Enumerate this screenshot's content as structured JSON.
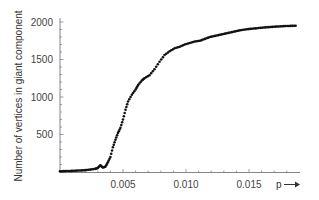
{
  "chart_data": {
    "type": "scatter",
    "title": "",
    "xlabel": "p",
    "xlabel_arrow": "→",
    "ylabel": "Number of vertices in giant component",
    "xlim": [
      0,
      0.019
    ],
    "ylim": [
      0,
      2050
    ],
    "grid": false,
    "legend": null,
    "x_ticks": [
      0.005,
      0.01,
      0.015
    ],
    "x_tick_labels": [
      "0.005",
      "0.010",
      "0.015"
    ],
    "y_ticks": [
      500,
      1000,
      1500,
      2000
    ],
    "y_tick_labels": [
      "500",
      "1000",
      "1500",
      "2000"
    ],
    "series": [
      {
        "name": "giant component size",
        "color": "#111111",
        "x": [
          0.0,
          0.0004,
          0.0008,
          0.0012,
          0.0016,
          0.002,
          0.0024,
          0.0028,
          0.003,
          0.0032,
          0.0034,
          0.0036,
          0.0038,
          0.004,
          0.0042,
          0.0044,
          0.0046,
          0.0048,
          0.005,
          0.0052,
          0.0054,
          0.0057,
          0.006,
          0.0062,
          0.0065,
          0.0067,
          0.0071,
          0.0075,
          0.0079,
          0.0083,
          0.0087,
          0.0091,
          0.0095,
          0.0099,
          0.0103,
          0.0107,
          0.0111,
          0.0115,
          0.0119,
          0.0123,
          0.0127,
          0.0131,
          0.0135,
          0.0139,
          0.0143,
          0.0147,
          0.0151,
          0.0155,
          0.0159,
          0.0163,
          0.0167,
          0.0171,
          0.0175,
          0.0179,
          0.0183,
          0.0187
        ],
        "y": [
          10,
          12,
          14,
          17,
          20,
          25,
          32,
          42,
          55,
          90,
          60,
          70,
          130,
          200,
          330,
          430,
          520,
          590,
          700,
          830,
          940,
          1030,
          1100,
          1160,
          1220,
          1250,
          1290,
          1370,
          1470,
          1560,
          1610,
          1650,
          1670,
          1700,
          1720,
          1740,
          1750,
          1775,
          1800,
          1815,
          1830,
          1845,
          1860,
          1875,
          1890,
          1900,
          1908,
          1915,
          1922,
          1928,
          1933,
          1938,
          1942,
          1946,
          1948,
          1950
        ]
      }
    ]
  }
}
